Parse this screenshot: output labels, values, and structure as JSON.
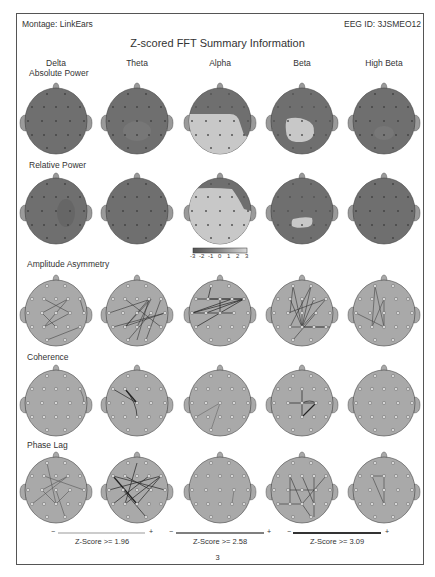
{
  "header": {
    "montage": "Montage: LinkEars",
    "eeg_id": "EEG ID: 3JSMEO12",
    "title": "Z-scored FFT Summary Information"
  },
  "bands": [
    "Delta",
    "Theta",
    "Alpha",
    "Beta",
    "High Beta"
  ],
  "rows": [
    {
      "label": "Absolute Power",
      "type": "power"
    },
    {
      "label": "Relative Power",
      "type": "power"
    },
    {
      "label": "Amplitude Asymmetry",
      "type": "connect"
    },
    {
      "label": "Coherence",
      "type": "connect"
    },
    {
      "label": "Phase Lag",
      "type": "connect"
    }
  ],
  "colorscale": {
    "ticks": [
      "-3",
      "-2",
      "-1",
      "0",
      "1",
      "2",
      "3"
    ],
    "dark": "#6e6e6e",
    "light": "#c9c9c9"
  },
  "zscore_legend": [
    {
      "label": "Z-Score >= 1.96",
      "minus": "−",
      "plus": "+"
    },
    {
      "label": "Z-Score >= 2.58",
      "minus": "−",
      "plus": "+"
    },
    {
      "label": "Z-Score >= 3.09",
      "minus": "−",
      "plus": "+"
    }
  ],
  "page_number": "3",
  "colors": {
    "head_dark": "#6f6f6f",
    "head_connect": "#a9a9a9",
    "highlight": "#c8c8c8",
    "border": "#555555"
  }
}
